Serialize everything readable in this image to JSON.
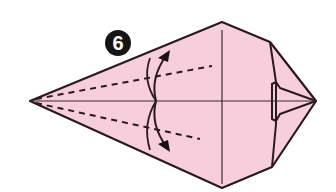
{
  "diagram": {
    "step_number": "6",
    "colors": {
      "paper": "#f7cfdc",
      "outline": "#2a1a1e",
      "background": "#ffffff",
      "badge": "#151515",
      "badge_text": "#ffffff"
    },
    "elements": [
      {
        "type": "paper-shape",
        "description": "kite-shaped folded model pointing left"
      },
      {
        "type": "valley-fold-line",
        "position": "upper",
        "style": "dashed"
      },
      {
        "type": "valley-fold-line",
        "position": "lower",
        "style": "dashed"
      },
      {
        "type": "crease-line",
        "position": "horizontal-center"
      },
      {
        "type": "crease-line",
        "position": "vertical-center"
      },
      {
        "type": "fold-arrow",
        "direction": "up",
        "position": "upper"
      },
      {
        "type": "fold-arrow",
        "direction": "down",
        "position": "lower"
      },
      {
        "type": "layered-flap",
        "position": "right"
      }
    ]
  }
}
